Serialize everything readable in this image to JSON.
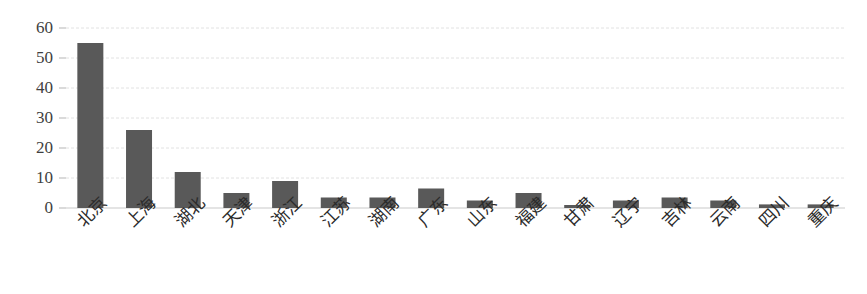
{
  "chart_data": {
    "type": "bar",
    "title": "",
    "xlabel": "",
    "ylabel": "",
    "ylim": [
      0,
      60
    ],
    "yticks": [
      0,
      10,
      20,
      30,
      40,
      50,
      60
    ],
    "grid": true,
    "legend": false,
    "legend_position": "none",
    "bar_color": "#595959",
    "gridline_color": "#e2e2e2",
    "axis_color": "#c9c9c9",
    "categories": [
      "北京",
      "上海",
      "湖北",
      "天津",
      "浙江",
      "江苏",
      "湖南",
      "广东",
      "山东",
      "福建",
      "甘肃",
      "辽宁",
      "吉林",
      "云南",
      "四川",
      "重庆"
    ],
    "values": [
      55,
      26,
      12,
      5,
      9,
      3.5,
      3.5,
      6.5,
      2.5,
      5,
      1,
      2.5,
      3.5,
      2.5,
      1.2,
      1.2
    ]
  }
}
